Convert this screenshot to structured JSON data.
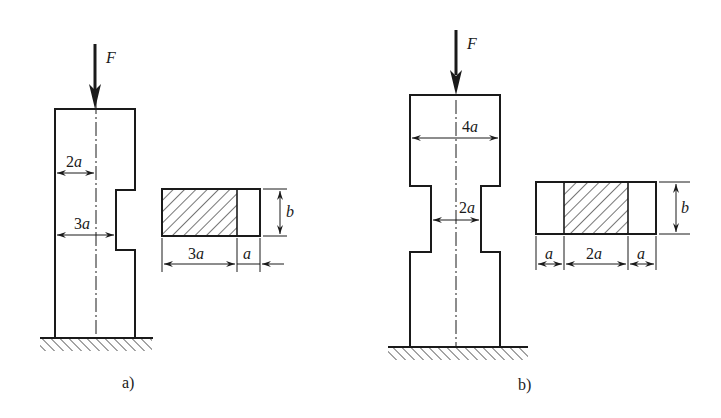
{
  "figure_a": {
    "caption": "a)",
    "force_label": "F",
    "dim_top": {
      "num": "2",
      "var": "a"
    },
    "dim_notch": {
      "num": "3",
      "var": "a"
    },
    "section": {
      "width_main": {
        "num": "3",
        "var": "a"
      },
      "width_side": {
        "var": "a"
      },
      "height": {
        "var": "b"
      }
    }
  },
  "figure_b": {
    "caption": "b)",
    "force_label": "F",
    "dim_top": {
      "num": "4",
      "var": "a"
    },
    "dim_neck": {
      "num": "2",
      "var": "a"
    },
    "section": {
      "width_left": {
        "var": "a"
      },
      "width_mid": {
        "num": "2",
        "var": "a"
      },
      "width_right": {
        "var": "a"
      },
      "height": {
        "var": "b"
      }
    }
  },
  "colors": {
    "line": "#1a1a1a",
    "background": "#ffffff"
  }
}
